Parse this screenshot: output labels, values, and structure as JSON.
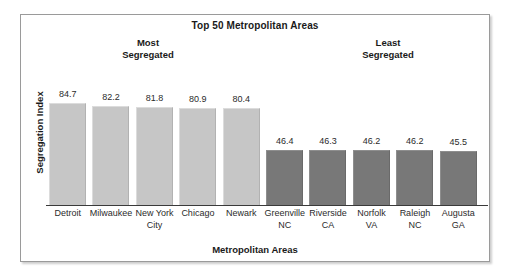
{
  "chart_data": {
    "type": "bar",
    "title": "Top 50 Metropolitan Areas",
    "xlabel": "Metropolitan Areas",
    "ylabel": "Segregation Index",
    "ylim": [
      0,
      100
    ],
    "grid": false,
    "legend": "none",
    "categories": [
      "Detroit",
      "Milwaukee",
      "New York City",
      "Chicago",
      "Newark",
      "Greenville NC",
      "Riverside CA",
      "Norfolk VA",
      "Raleigh NC",
      "Augusta GA"
    ],
    "values": [
      84.7,
      82.2,
      81.8,
      80.9,
      80.4,
      46.4,
      46.3,
      46.2,
      46.2,
      45.5
    ],
    "annotations": [
      {
        "text": "Most\nSegregated",
        "group": "most-segregated"
      },
      {
        "text": "Least\nSegregated",
        "group": "least-segregated"
      }
    ],
    "bars": [
      {
        "label_line1": "Detroit",
        "label_line2": "",
        "value": 84.7,
        "value_label": "84.7",
        "color": "#c6c6c6",
        "group": "most-segregated"
      },
      {
        "label_line1": "Milwaukee",
        "label_line2": "",
        "value": 82.2,
        "value_label": "82.2",
        "color": "#c6c6c6",
        "group": "most-segregated"
      },
      {
        "label_line1": "New York",
        "label_line2": "City",
        "value": 81.8,
        "value_label": "81.8",
        "color": "#c6c6c6",
        "group": "most-segregated"
      },
      {
        "label_line1": "Chicago",
        "label_line2": "",
        "value": 80.9,
        "value_label": "80.9",
        "color": "#c6c6c6",
        "group": "most-segregated"
      },
      {
        "label_line1": "Newark",
        "label_line2": "",
        "value": 80.4,
        "value_label": "80.4",
        "color": "#c6c6c6",
        "group": "most-segregated"
      },
      {
        "label_line1": "Greenville",
        "label_line2": "NC",
        "value": 46.4,
        "value_label": "46.4",
        "color": "#787878",
        "group": "least-segregated"
      },
      {
        "label_line1": "Riverside",
        "label_line2": "CA",
        "value": 46.3,
        "value_label": "46.3",
        "color": "#787878",
        "group": "least-segregated"
      },
      {
        "label_line1": "Norfolk",
        "label_line2": "VA",
        "value": 46.2,
        "value_label": "46.2",
        "color": "#787878",
        "group": "least-segregated"
      },
      {
        "label_line1": "Raleigh",
        "label_line2": "NC",
        "value": 46.2,
        "value_label": "46.2",
        "color": "#787878",
        "group": "least-segregated"
      },
      {
        "label_line1": "Augusta",
        "label_line2": "GA",
        "value": 45.5,
        "value_label": "45.5",
        "color": "#787878",
        "group": "least-segregated"
      }
    ]
  },
  "annotation_most": "Most\nSegregated",
  "annotation_least": "Least\nSegregated"
}
